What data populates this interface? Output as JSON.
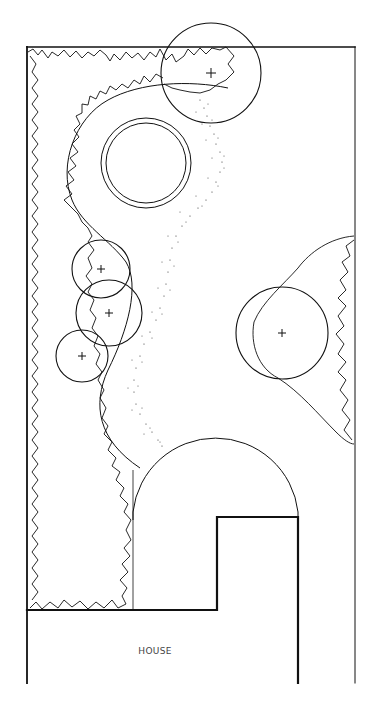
{
  "diagram": {
    "type": "garden-plan",
    "labels": {
      "house": "HOUSE"
    },
    "elements": [
      {
        "id": "boundary",
        "kind": "property-boundary"
      },
      {
        "id": "left-hedge",
        "kind": "planting-border"
      },
      {
        "id": "right-shrub-bed",
        "kind": "planting-border"
      },
      {
        "id": "lawn",
        "kind": "curved-lawn"
      },
      {
        "id": "gravel-path",
        "kind": "stippled-path"
      },
      {
        "id": "pond",
        "kind": "double-circle"
      },
      {
        "id": "patio",
        "kind": "semicircular-terrace"
      },
      {
        "id": "house",
        "kind": "building-footprint"
      }
    ],
    "trees": [
      {
        "name": "tree-top-right",
        "cx": 211,
        "cy": 73,
        "r": 50
      },
      {
        "name": "tree-left-1",
        "cx": 101,
        "cy": 269,
        "r": 29
      },
      {
        "name": "tree-left-2",
        "cx": 109,
        "cy": 313,
        "r": 33
      },
      {
        "name": "tree-left-3",
        "cx": 82,
        "cy": 356,
        "r": 26
      },
      {
        "name": "tree-right",
        "cx": 282,
        "cy": 333,
        "r": 46
      }
    ],
    "colors": {
      "line": "#111111",
      "label": "#444444",
      "background": "#ffffff"
    }
  }
}
